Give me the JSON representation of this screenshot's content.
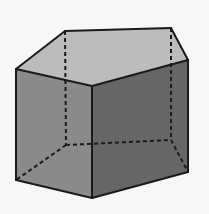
{
  "figure": {
    "background": "#f7f7f7",
    "edge_color": "#1a1a1a",
    "vertices": {
      "top_back_left": [
        65,
        31
      ],
      "top_back_right": [
        171,
        28
      ],
      "top_right": [
        188,
        60
      ],
      "top_front": [
        92,
        86
      ],
      "top_left": [
        16,
        69
      ],
      "bot_back_left": [
        66,
        145
      ],
      "bot_back_right": [
        171,
        140
      ],
      "bot_right": [
        188,
        172
      ],
      "bot_front": [
        92,
        198
      ],
      "bot_left": [
        16,
        180
      ]
    },
    "faces": [
      {
        "name": "top-face",
        "color": "#bcbcbc",
        "points": [
          "top_back_left",
          "top_back_right",
          "top_right",
          "top_front",
          "top_left"
        ]
      },
      {
        "name": "left-front-face",
        "color": "#8a8a8a",
        "points": [
          "top_left",
          "top_front",
          "bot_front",
          "bot_left"
        ]
      },
      {
        "name": "right-front-face",
        "color": "#666666",
        "points": [
          "top_front",
          "top_right",
          "bot_right",
          "bot_front"
        ]
      }
    ],
    "visible_edges": [
      [
        "top_back_left",
        "top_back_right"
      ],
      [
        "top_back_right",
        "top_right"
      ],
      [
        "top_right",
        "top_front"
      ],
      [
        "top_front",
        "top_left"
      ],
      [
        "top_left",
        "top_back_left"
      ],
      [
        "top_left",
        "bot_left"
      ],
      [
        "top_front",
        "bot_front"
      ],
      [
        "top_right",
        "bot_right"
      ],
      [
        "bot_left",
        "bot_front"
      ],
      [
        "bot_front",
        "bot_right"
      ]
    ],
    "hidden_edges": [
      [
        "top_back_left",
        "bot_back_left"
      ],
      [
        "top_back_right",
        "bot_back_right"
      ],
      [
        "bot_back_left",
        "bot_back_right"
      ],
      [
        "bot_back_left",
        "bot_left"
      ],
      [
        "bot_back_right",
        "bot_right"
      ]
    ]
  }
}
